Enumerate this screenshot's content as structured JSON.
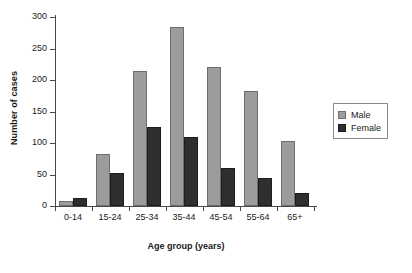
{
  "chart_data": {
    "type": "bar",
    "title": "",
    "xlabel": "Age group (years)",
    "ylabel": "Number of cases",
    "categories": [
      "0-14",
      "15-24",
      "25-34",
      "35-44",
      "45-54",
      "55-64",
      "65+"
    ],
    "series": [
      {
        "name": "Male",
        "color": "#9c9c9c",
        "values": [
          8,
          82,
          215,
          284,
          220,
          182,
          103
        ]
      },
      {
        "name": "Female",
        "color": "#2f2f2f",
        "values": [
          13,
          52,
          125,
          110,
          60,
          45,
          21
        ]
      }
    ],
    "ylim": [
      0,
      300
    ],
    "yticks": [
      0,
      50,
      100,
      150,
      200,
      250,
      300
    ],
    "ytick_labels": [
      "0",
      "50",
      "100",
      "150",
      "200",
      "250",
      "300"
    ],
    "grid": false,
    "legend_position": "right-outside",
    "legend_entries": [
      "Male",
      "Female"
    ]
  }
}
